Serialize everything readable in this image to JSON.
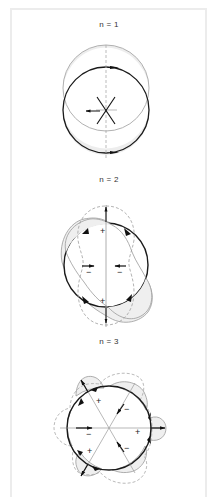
{
  "figure": {
    "panels": [
      {
        "title": "n = 1",
        "mode": 1,
        "labels": []
      },
      {
        "title": "n = 2",
        "mode": 2,
        "labels": [
          "+",
          "+",
          "−",
          "−"
        ]
      },
      {
        "title": "n = 3",
        "mode": 3,
        "labels": [
          "+",
          "+",
          "+",
          "−",
          "−",
          "−"
        ]
      }
    ],
    "legend": {
      "undeformed": "thick black circle",
      "deformed": "thin gray outline, shaded displacement region",
      "alternate_phase": "dashed gray outline"
    },
    "colors": {
      "circle": "#1a1a1a",
      "deformed": "#9a9a9a",
      "shade": "#ececec",
      "dashed": "#a0a0a0",
      "frame": "#ececec"
    }
  }
}
